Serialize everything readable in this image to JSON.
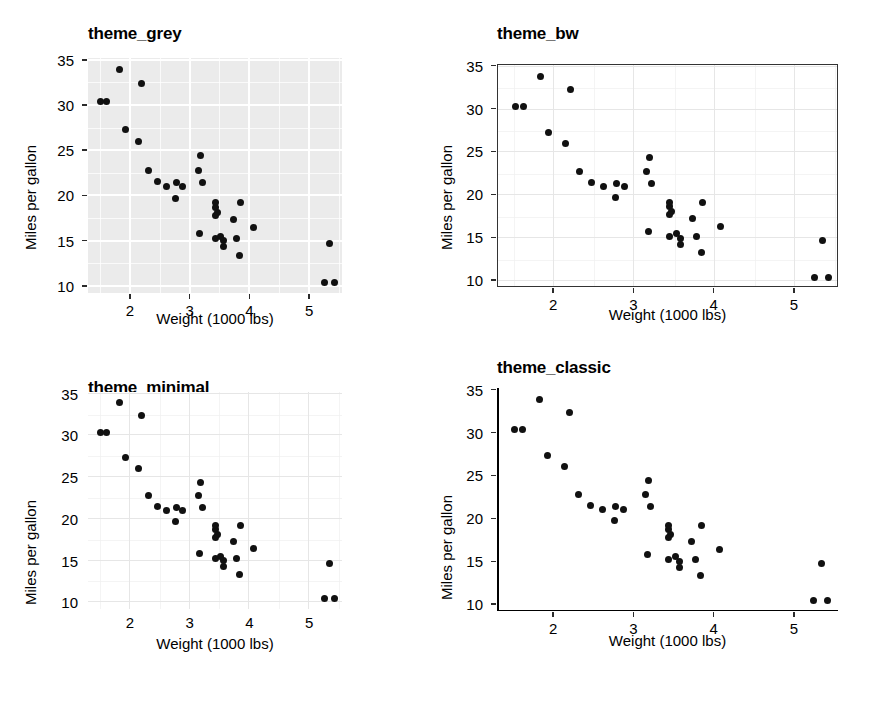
{
  "figure": {
    "n_panels": 4,
    "background": "#ffffff",
    "point_color": "#111111"
  },
  "axis": {
    "xlabel": "Weight (1000 lbs)",
    "ylabel": "Miles per gallon",
    "xticks": [
      2,
      3,
      4,
      5
    ],
    "yticks": [
      10,
      15,
      20,
      25,
      30,
      35
    ],
    "xlim": [
      1.3,
      5.55
    ],
    "ylim": [
      9.2,
      35.2
    ]
  },
  "panels": [
    {
      "id": "theme_grey",
      "title": "theme_grey",
      "panel_fill": "#ebebeb",
      "grid_color": "#ffffff",
      "border": false,
      "axis_lines": false,
      "ticks": true,
      "grid_minor": true
    },
    {
      "id": "theme_bw",
      "title": "theme_bw",
      "panel_fill": "#ffffff",
      "grid_color": "#e6e6e6",
      "border": true,
      "border_color": "#333333",
      "axis_lines": false,
      "ticks": true,
      "grid_minor": true
    },
    {
      "id": "theme_minimal",
      "title": "theme_minimal",
      "panel_fill": "#ffffff",
      "grid_color": "#e6e6e6",
      "border": false,
      "axis_lines": false,
      "ticks": false,
      "grid_minor": true
    },
    {
      "id": "theme_classic",
      "title": "theme_classic",
      "panel_fill": "#ffffff",
      "grid_color": "none",
      "border": false,
      "axis_lines": true,
      "axis_color": "#000000",
      "ticks": true,
      "grid_minor": false
    }
  ],
  "chart_data": {
    "type": "scatter",
    "xlabel": "Weight (1000 lbs)",
    "ylabel": "Miles per gallon",
    "xlim": [
      1.3,
      5.55
    ],
    "ylim": [
      9.2,
      35.2
    ],
    "xticks": [
      2,
      3,
      4,
      5
    ],
    "yticks": [
      10,
      15,
      20,
      25,
      30,
      35
    ],
    "grid": true,
    "legend": "none",
    "series": [
      {
        "name": "mtcars",
        "x": [
          2.62,
          2.875,
          2.32,
          3.215,
          3.44,
          3.46,
          3.57,
          3.19,
          3.15,
          3.44,
          3.44,
          4.07,
          3.73,
          3.78,
          5.25,
          5.424,
          5.345,
          2.2,
          1.615,
          1.835,
          2.465,
          3.52,
          3.435,
          3.84,
          3.845,
          1.935,
          2.14,
          1.513,
          3.17,
          2.77,
          3.57,
          2.78
        ],
        "y": [
          21.0,
          21.0,
          22.8,
          21.4,
          18.7,
          18.1,
          14.3,
          24.4,
          22.8,
          19.2,
          17.8,
          16.4,
          17.3,
          15.2,
          10.4,
          10.4,
          14.7,
          32.4,
          30.4,
          33.9,
          21.5,
          15.5,
          15.2,
          13.3,
          19.2,
          27.3,
          26.0,
          30.4,
          15.8,
          19.7,
          15.0,
          21.4
        ]
      }
    ]
  }
}
